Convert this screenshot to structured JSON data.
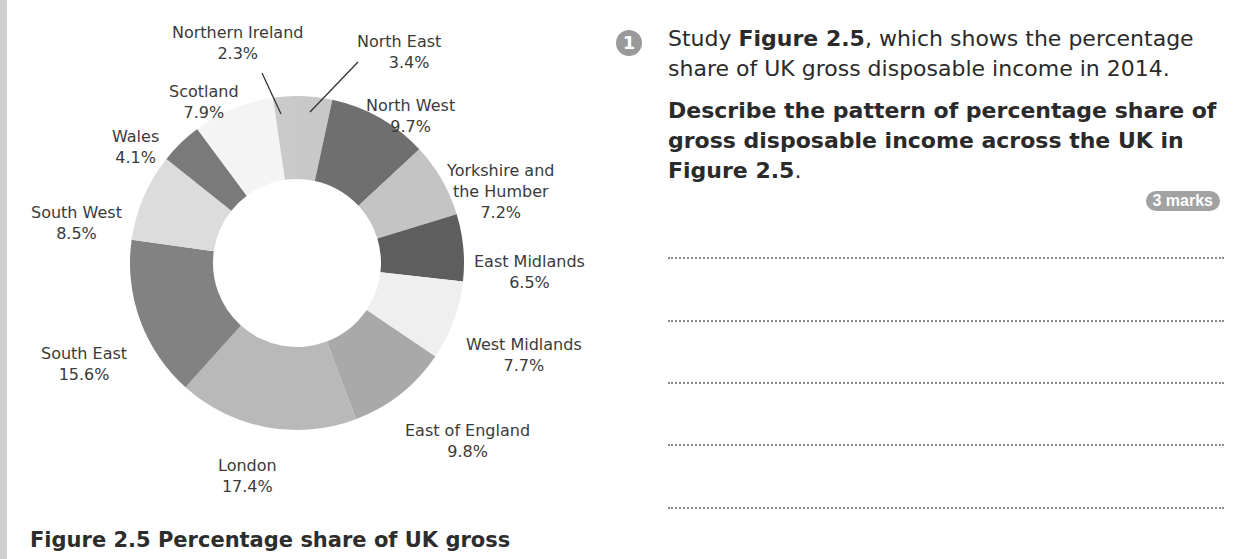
{
  "chart_data": {
    "type": "pie",
    "variant": "donut",
    "title": "Figure 2.5 Percentage share of UK gross",
    "unit": "%",
    "categories": [
      "North East",
      "North West",
      "Yorkshire and the Humber",
      "East Midlands",
      "West Midlands",
      "East of England",
      "London",
      "South East",
      "South West",
      "Wales",
      "Scotland",
      "Northern Ireland"
    ],
    "values": [
      3.4,
      9.7,
      7.2,
      6.5,
      7.7,
      9.8,
      17.4,
      15.6,
      8.5,
      4.1,
      7.9,
      2.3
    ],
    "colors": [
      "#c8c8c8",
      "#6f6f6f",
      "#c4c4c4",
      "#5e5e5e",
      "#efefef",
      "#a9a9a9",
      "#b9b9b9",
      "#828282",
      "#dcdcdc",
      "#7a7a7a",
      "#f4f4f4",
      "#cacaca"
    ],
    "start_angle_deg": 0,
    "direction": "clockwise",
    "legend": "direct labels"
  },
  "labels": [
    {
      "name": "Northern Ireland",
      "value": "2.3%"
    },
    {
      "name": "North East",
      "value": "3.4%"
    },
    {
      "name": "Scotland",
      "value": "7.9%"
    },
    {
      "name": "North West",
      "value": "9.7%"
    },
    {
      "name": "Wales",
      "value": "4.1%"
    },
    {
      "name": "Yorkshire and",
      "name2": "the Humber",
      "value": "7.2%"
    },
    {
      "name": "South West",
      "value": "8.5%"
    },
    {
      "name": "East Midlands",
      "value": "6.5%"
    },
    {
      "name": "South East",
      "value": "15.6%"
    },
    {
      "name": "West Midlands",
      "value": "7.7%"
    },
    {
      "name": "East of England",
      "value": "9.8%"
    },
    {
      "name": "London",
      "value": "17.4%"
    }
  ],
  "caption": "Figure 2.5 Percentage share of UK gross",
  "question": {
    "number": "1",
    "line1_pre": "Study ",
    "line1_bold": "Figure 2.5",
    "line1_post": ", which shows the percentage share of UK gross disposable income in 2014.",
    "line2": "Describe the pattern of percentage share of gross disposable income across the UK in ",
    "line2_bold": "Figure 2.5",
    "line2_post": ".",
    "marks": "3 marks"
  },
  "answer_lines": 5
}
